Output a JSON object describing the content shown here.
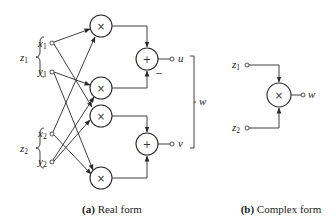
{
  "figure": {
    "real_form": {
      "caption_tag": "(a)",
      "caption_text": " Real form",
      "groups": [
        {
          "label": "z",
          "sub": "1",
          "inputs": [
            {
              "label": "x",
              "sub": "1"
            },
            {
              "label": "y",
              "sub": "1"
            }
          ]
        },
        {
          "label": "z",
          "sub": "2",
          "inputs": [
            {
              "label": "x",
              "sub": "2"
            },
            {
              "label": "y",
              "sub": "2"
            }
          ]
        }
      ],
      "multipliers": [
        "×",
        "×",
        "×",
        "×"
      ],
      "adders": [
        "+",
        "+"
      ],
      "adder1_minus_sign": "−",
      "outputs": [
        {
          "label": "u"
        },
        {
          "label": "v"
        }
      ],
      "output_group_label": "w"
    },
    "complex_form": {
      "caption_tag": "(b)",
      "caption_text": " Complex form",
      "inputs": [
        {
          "label": "z",
          "sub": "1"
        },
        {
          "label": "z",
          "sub": "2"
        }
      ],
      "multiplier": "×",
      "output": {
        "label": "w"
      }
    },
    "colors": {
      "stroke": "#2a2a2a",
      "background": "#ffffff"
    }
  }
}
